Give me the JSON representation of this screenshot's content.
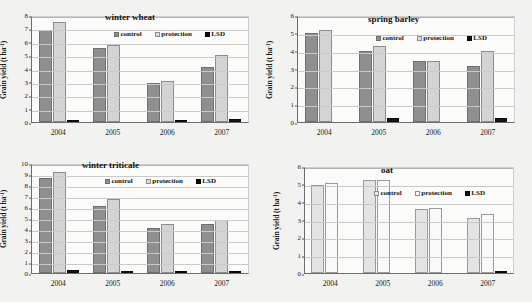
{
  "figure": {
    "axis_label": "Grain yield (t ha",
    "axis_label_sup": "-1",
    "axis_label_tail": ")",
    "legend": {
      "control": "control",
      "protection": "protection",
      "lsd": "LSD"
    },
    "colors": {
      "control": "#8f8f8f",
      "protection": "#d4d4d4",
      "lsd": "#151515",
      "oat_control": "#e4e4e4",
      "oat_protection": "#fafafa",
      "grid": "#c9c9c9",
      "axis": "#6d6d6d",
      "background": "#f2f2f0",
      "plot_background": "#fbfbfa"
    }
  },
  "chart_data": [
    {
      "type": "bar",
      "title": "winter wheat",
      "xlabel": "",
      "ylabel": "Grain yield (t ha-1)",
      "ylim": [
        0,
        8
      ],
      "yticks": [
        0,
        1,
        2,
        3,
        4,
        5,
        6,
        7,
        8
      ],
      "grid": true,
      "legend_position": "top-right",
      "categories": [
        "2004",
        "2005",
        "2006",
        "2007"
      ],
      "series": [
        {
          "name": "control",
          "values": [
            6.85,
            5.55,
            2.95,
            4.15
          ]
        },
        {
          "name": "protection",
          "values": [
            7.45,
            5.75,
            3.05,
            5.0
          ]
        },
        {
          "name": "LSD",
          "values": [
            0.12,
            0,
            0.11,
            0.2
          ]
        }
      ]
    },
    {
      "type": "bar",
      "title": "spring barley",
      "xlabel": "",
      "ylabel": "Grain yield (t ha-1)",
      "ylim": [
        0,
        6
      ],
      "yticks": [
        0,
        1,
        2,
        3,
        4,
        5,
        6
      ],
      "grid": true,
      "legend_position": "top-right",
      "categories": [
        "2004",
        "2005",
        "2006",
        "2007"
      ],
      "series": [
        {
          "name": "control",
          "values": [
            5.0,
            4.0,
            3.42,
            3.15
          ]
        },
        {
          "name": "protection",
          "values": [
            5.17,
            4.28,
            3.4,
            4.0
          ]
        },
        {
          "name": "LSD",
          "values": [
            0,
            0.2,
            0,
            0.22
          ]
        }
      ]
    },
    {
      "type": "bar",
      "title": "winter triticale",
      "xlabel": "",
      "ylabel": "Grain yield (t ha-1)",
      "ylim": [
        0,
        10
      ],
      "yticks": [
        0,
        1,
        2,
        3,
        4,
        5,
        6,
        7,
        8,
        9,
        10
      ],
      "grid": true,
      "legend_position": "top-right",
      "categories": [
        "2004",
        "2005",
        "2006",
        "2007"
      ],
      "series": [
        {
          "name": "control",
          "values": [
            8.68,
            6.1,
            4.08,
            4.45
          ]
        },
        {
          "name": "protection",
          "values": [
            9.2,
            6.75,
            4.45,
            4.8
          ]
        },
        {
          "name": "LSD",
          "values": [
            0.25,
            0.12,
            0.15,
            0.15
          ]
        }
      ]
    },
    {
      "type": "bar",
      "title": "oat",
      "xlabel": "",
      "ylabel": "Grain yield (t ha-1)",
      "ylim": [
        0,
        6
      ],
      "yticks": [
        0,
        1,
        2,
        3,
        4,
        5,
        6
      ],
      "grid": true,
      "legend_position": "top-right",
      "categories": [
        "2004",
        "2005",
        "2006",
        "2007"
      ],
      "series": [
        {
          "name": "control",
          "values": [
            4.95,
            5.2,
            3.57,
            3.07
          ]
        },
        {
          "name": "protection",
          "values": [
            5.05,
            5.2,
            3.62,
            3.3
          ]
        },
        {
          "name": "LSD",
          "values": [
            0,
            0,
            0,
            0.12
          ]
        }
      ]
    }
  ]
}
